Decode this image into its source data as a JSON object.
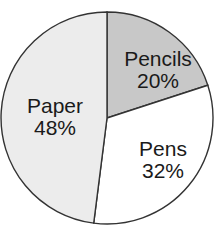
{
  "chart_data": {
    "type": "pie",
    "title": "",
    "categories": [
      "Pencils",
      "Pens",
      "Paper"
    ],
    "values": [
      20,
      32,
      48
    ],
    "labels": [
      "Pencils 20%",
      "Pens 32%",
      "Paper 48%"
    ],
    "colors": [
      "#c8c8c8",
      "#ffffff",
      "#ececec"
    ],
    "start_angle_deg": 0,
    "direction": "clockwise",
    "legend": "none"
  },
  "slices": [
    {
      "name": "Pencils",
      "pct": "20%",
      "color": "#c8c8c8"
    },
    {
      "name": "Pens",
      "pct": "32%",
      "color": "#ffffff"
    },
    {
      "name": "Paper",
      "pct": "48%",
      "color": "#ececec"
    }
  ]
}
